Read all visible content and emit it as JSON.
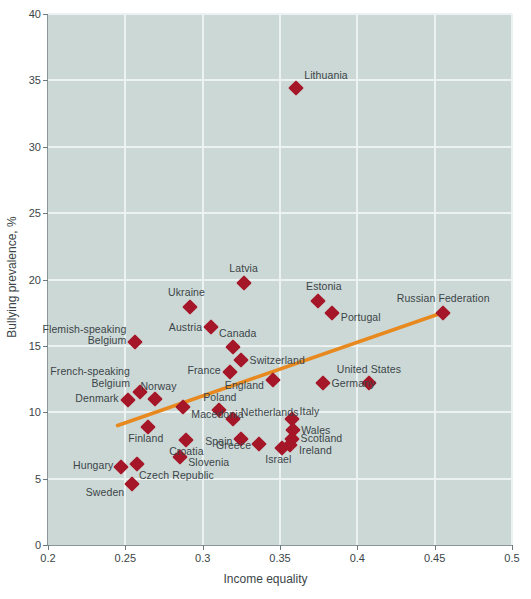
{
  "chart_data": {
    "type": "scatter",
    "title": "",
    "xlabel": "Income equality",
    "ylabel": "Bullying prevalence, %",
    "xlim": [
      0.2,
      0.5
    ],
    "ylim": [
      0,
      40
    ],
    "xticks": [
      "0.2",
      "0.25",
      "0.3",
      "0.35",
      "0.4",
      "0.45",
      "0.5"
    ],
    "xtick_values": [
      0.2,
      0.25,
      0.3,
      0.35,
      0.4,
      0.45,
      0.5
    ],
    "yticks": [
      "0",
      "5",
      "10",
      "15",
      "20",
      "25",
      "30",
      "35",
      "40"
    ],
    "ytick_values": [
      0,
      5,
      10,
      15,
      20,
      25,
      30,
      35,
      40
    ],
    "grid": true,
    "legend": "none",
    "marker_color": "#a51728",
    "trend_color": "#e8891f",
    "plot_background": "#ccd8d6",
    "gridline_color": "#ecf2f1",
    "trendline": {
      "x0": 0.245,
      "y0": 9.0,
      "x1": 0.455,
      "y1": 17.5
    },
    "points": [
      {
        "name": "Lithuania",
        "x": 0.3605,
        "y": 34.4,
        "label_pos": "right",
        "label_dx": 8,
        "label_dy": -12
      },
      {
        "name": "Latvia",
        "x": 0.3265,
        "y": 19.7,
        "label_pos": "center",
        "label_dx": 0,
        "label_dy": -14
      },
      {
        "name": "Estonia",
        "x": 0.3745,
        "y": 18.4,
        "label_pos": "center",
        "label_dx": 6,
        "label_dy": -14
      },
      {
        "name": "Portugal",
        "x": 0.3835,
        "y": 17.5,
        "label_pos": "right",
        "label_dx": 9,
        "label_dy": 5
      },
      {
        "name": "Ukraine",
        "x": 0.2915,
        "y": 17.9,
        "label_pos": "center",
        "label_dx": -3,
        "label_dy": -14
      },
      {
        "name": "Russian Federation",
        "x": 0.4555,
        "y": 17.5,
        "label_pos": "center",
        "label_dx": 0,
        "label_dy": -14
      },
      {
        "name": "Austria",
        "x": 0.3055,
        "y": 16.4,
        "label_pos": "left",
        "label_dx": -9,
        "label_dy": 1
      },
      {
        "name": "Flemish-speaking\nBelgium",
        "x": 0.2565,
        "y": 15.3,
        "label_pos": "left",
        "label_dx": -9,
        "label_dy": -7
      },
      {
        "name": "Canada",
        "x": 0.3195,
        "y": 14.9,
        "label_pos": "center",
        "label_dx": 5,
        "label_dy": -13
      },
      {
        "name": "Switzerland",
        "x": 0.3245,
        "y": 13.9,
        "label_pos": "right",
        "label_dx": 9,
        "label_dy": 1
      },
      {
        "name": "France",
        "x": 0.3175,
        "y": 13.0,
        "label_pos": "left",
        "label_dx": -9,
        "label_dy": -1
      },
      {
        "name": "England",
        "x": 0.3455,
        "y": 12.4,
        "label_pos": "left",
        "label_dx": -9,
        "label_dy": 6
      },
      {
        "name": "Germany",
        "x": 0.3775,
        "y": 12.2,
        "label_pos": "right",
        "label_dx": 9,
        "label_dy": 1
      },
      {
        "name": "United States",
        "x": 0.4075,
        "y": 12.2,
        "label_pos": "center",
        "label_dx": 0,
        "label_dy": -13
      },
      {
        "name": "French-speaking\nBelgium",
        "x": 0.2595,
        "y": 11.5,
        "label_pos": "left",
        "label_dx": -10,
        "label_dy": -15
      },
      {
        "name": "Norway",
        "x": 0.2695,
        "y": 11.0,
        "label_pos": "center",
        "label_dx": 3,
        "label_dy": -12
      },
      {
        "name": "Denmark",
        "x": 0.2515,
        "y": 10.9,
        "label_pos": "left",
        "label_dx": -9,
        "label_dy": -1
      },
      {
        "name": "Poland",
        "x": 0.3105,
        "y": 10.2,
        "label_pos": "center",
        "label_dx": 1,
        "label_dy": -12
      },
      {
        "name": "Macedonia",
        "x": 0.2875,
        "y": 10.4,
        "label_pos": "right",
        "label_dx": 8,
        "label_dy": 8
      },
      {
        "name": "Netherlands",
        "x": 0.3195,
        "y": 9.5,
        "label_pos": "right",
        "label_dx": 8,
        "label_dy": -6
      },
      {
        "name": "Italy",
        "x": 0.3575,
        "y": 9.5,
        "label_pos": "right",
        "label_dx": 8,
        "label_dy": -7
      },
      {
        "name": "Wales",
        "x": 0.3585,
        "y": 8.7,
        "label_pos": "right",
        "label_dx": 8,
        "label_dy": 1
      },
      {
        "name": "Scotland",
        "x": 0.3575,
        "y": 8.0,
        "label_pos": "right",
        "label_dx": 9,
        "label_dy": 0
      },
      {
        "name": "Ireland",
        "x": 0.3565,
        "y": 7.5,
        "label_pos": "right",
        "label_dx": 9,
        "label_dy": 6
      },
      {
        "name": "Israel",
        "x": 0.3515,
        "y": 7.3,
        "label_pos": "center",
        "label_dx": -4,
        "label_dy": 12
      },
      {
        "name": "Greece",
        "x": 0.3365,
        "y": 7.6,
        "label_pos": "left",
        "label_dx": -8,
        "label_dy": 2
      },
      {
        "name": "Spain",
        "x": 0.3245,
        "y": 8.0,
        "label_pos": "left",
        "label_dx": -8,
        "label_dy": 3
      },
      {
        "name": "Finland",
        "x": 0.2645,
        "y": 8.9,
        "label_pos": "center",
        "label_dx": -2,
        "label_dy": 12
      },
      {
        "name": "Croatia",
        "x": 0.2895,
        "y": 7.9,
        "label_pos": "center",
        "label_dx": 0,
        "label_dy": 12
      },
      {
        "name": "Slovenia",
        "x": 0.2855,
        "y": 6.6,
        "label_pos": "right",
        "label_dx": 8,
        "label_dy": 6
      },
      {
        "name": "Hungary",
        "x": 0.2475,
        "y": 5.9,
        "label_pos": "left",
        "label_dx": -8,
        "label_dy": -1
      },
      {
        "name": "Czech Republic",
        "x": 0.2575,
        "y": 6.1,
        "label_pos": "right",
        "label_dx": 2,
        "label_dy": 12
      },
      {
        "name": "Sweden",
        "x": 0.2545,
        "y": 4.6,
        "label_pos": "left",
        "label_dx": -8,
        "label_dy": 9
      }
    ]
  }
}
